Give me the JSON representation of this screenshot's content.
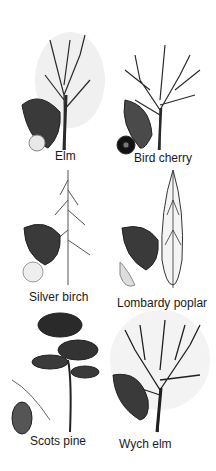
{
  "trees": [
    {
      "name": "Elm"
    },
    {
      "name": "Bird cherry"
    },
    {
      "name": "Silver birch"
    },
    {
      "name": "Lombardy poplar"
    },
    {
      "name": "Scots pine"
    },
    {
      "name": "Wych elm"
    }
  ],
  "colors": {
    "ink": "#1a1a1a",
    "leaf": "#3a3a3a",
    "background": "#ffffff"
  }
}
